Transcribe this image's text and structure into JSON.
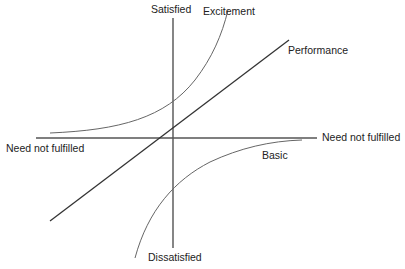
{
  "diagram": {
    "axes": {
      "top": "Satisfied",
      "bottom": "Dissatisfied",
      "left": "Need not fulfilled",
      "right": "Need not fulfilled"
    },
    "curves": {
      "excitement": "Excitement",
      "performance": "Performance",
      "basic": "Basic"
    },
    "colors": {
      "axis": "#444444",
      "performance": "#333333",
      "excitement": "#666666",
      "basic": "#666666",
      "text": "#222222"
    }
  }
}
